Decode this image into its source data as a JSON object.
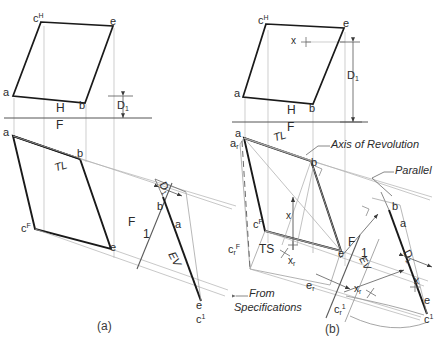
{
  "figure": {
    "captions": [
      {
        "id": "cap-a",
        "text": "(a)"
      },
      {
        "id": "cap-b",
        "text": "(b)"
      }
    ],
    "colors": {
      "object_line": "#1a1a1a",
      "construction_line": "#9a9a9a",
      "reference_line": "#6d6d6d",
      "text": "#2b2b2b",
      "paper": "#ffffff"
    }
  },
  "panel_a": {
    "name": "(a)",
    "top_view": {
      "vertex_labels": [
        {
          "key": "c",
          "text": "c",
          "sup": "H"
        },
        {
          "key": "e",
          "text": "e",
          "sup": ""
        },
        {
          "key": "a",
          "text": "a",
          "sup": ""
        },
        {
          "key": "b",
          "text": "b",
          "sup": ""
        }
      ]
    },
    "fold_line_hf": {
      "upper": "H",
      "lower": "F"
    },
    "front_view": {
      "vertex_labels": [
        {
          "key": "a",
          "text": "a",
          "sup": ""
        },
        {
          "key": "b",
          "text": "b",
          "sup": ""
        },
        {
          "key": "c",
          "text": "c",
          "sup": "F"
        },
        {
          "key": "e",
          "text": "e",
          "sup": ""
        }
      ],
      "true_length_label": "TL"
    },
    "fold_line_f1": {
      "upper": "F",
      "lower": "1"
    },
    "aux_view": {
      "vertex_labels": [
        {
          "key": "b",
          "text": "b",
          "sup": ""
        },
        {
          "key": "a",
          "text": "a",
          "sup": ""
        },
        {
          "key": "e",
          "text": "e",
          "sup": ""
        },
        {
          "key": "c",
          "text": "c",
          "sup": "1"
        }
      ],
      "edge_view_label": "EV",
      "dimension_label": "D",
      "dimension_sub": "1"
    },
    "height_dimension": {
      "label": "D",
      "sub": "1"
    }
  },
  "panel_b": {
    "name": "(b)",
    "top_view": {
      "vertex_labels": [
        {
          "key": "c",
          "text": "c",
          "sup": "H"
        },
        {
          "key": "e",
          "text": "e",
          "sup": ""
        },
        {
          "key": "a",
          "text": "a",
          "sup": ""
        },
        {
          "key": "b",
          "text": "b",
          "sup": ""
        }
      ],
      "point_marker": "x",
      "dimension_label": "D",
      "dimension_sub": "1"
    },
    "fold_line_hf": {
      "upper": "H",
      "lower": "F"
    },
    "front_view": {
      "vertex_labels": [
        {
          "key": "a",
          "text": "a",
          "sup": ""
        },
        {
          "key": "ar",
          "text": "a",
          "sub": "r"
        },
        {
          "key": "b",
          "text": "b",
          "sup": ""
        },
        {
          "key": "c",
          "text": "c",
          "sup": "F"
        },
        {
          "key": "crF",
          "text": "c",
          "sub": "r",
          "sup": "F"
        },
        {
          "key": "e",
          "text": "e",
          "sup": ""
        },
        {
          "key": "er",
          "text": "e",
          "sub": "r"
        }
      ],
      "true_length_label": "TL",
      "true_size_label": "TS",
      "point_marker": "x",
      "revolved_point_marker": "x",
      "revolved_point_sub": "r"
    },
    "fold_line_f1": {
      "upper": "F",
      "lower": "1"
    },
    "aux_view": {
      "vertex_labels": [
        {
          "key": "b",
          "text": "b",
          "sup": ""
        },
        {
          "key": "a",
          "text": "a",
          "sup": ""
        },
        {
          "key": "e",
          "text": "e",
          "sup": ""
        },
        {
          "key": "c",
          "text": "c",
          "sup": "1"
        },
        {
          "key": "cr1",
          "text": "c",
          "sub": "r",
          "sup": "1"
        }
      ],
      "edge_view_label": "EV",
      "dimension_label": "D",
      "dimension_sub": "1",
      "point_marker": "x",
      "revolved_point_marker": "x",
      "revolved_point_sub": "r"
    },
    "annotations": [
      {
        "key": "axis",
        "text": "Axis of Revolution"
      },
      {
        "key": "parallel",
        "text": "Parallel"
      },
      {
        "key": "from-spec-1",
        "text": "From"
      },
      {
        "key": "from-spec-2",
        "text": "Specifications"
      }
    ]
  }
}
